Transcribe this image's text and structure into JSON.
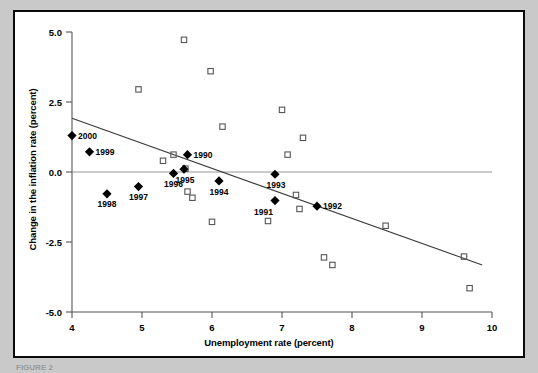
{
  "figure": {
    "caption": "FIGURE 2",
    "background_color": "#c9c9c9",
    "panel_color": "#ffffff",
    "border_color": "#0a0a0a"
  },
  "chart_data": {
    "type": "scatter",
    "title": "",
    "xlabel": "Unemployment rate (percent)",
    "ylabel": "Change in the inflation rate (percent)",
    "xlim": [
      4,
      10
    ],
    "ylim": [
      -5.0,
      5.0
    ],
    "xticks": [
      "4",
      "5",
      "6",
      "7",
      "8",
      "9",
      "10"
    ],
    "yticks": [
      "5.0",
      "2.5",
      "0.0",
      "-2.5",
      "-5.0"
    ],
    "xtick_values": [
      4,
      5,
      6,
      7,
      8,
      9,
      10
    ],
    "ytick_values": [
      5.0,
      2.5,
      0.0,
      -2.5,
      -5.0
    ],
    "grid": false,
    "legend": "none",
    "zero_line": true,
    "series": [
      {
        "name": "Labeled years (filled diamonds)",
        "marker": "filled-diamond",
        "color": "#000000",
        "points": [
          {
            "label": "2000",
            "x": 4.0,
            "y": 1.3,
            "label_pos": "right"
          },
          {
            "label": "1999",
            "x": 4.25,
            "y": 0.72,
            "label_pos": "right"
          },
          {
            "label": "1998",
            "x": 4.5,
            "y": -0.78,
            "label_pos": "below"
          },
          {
            "label": "1997",
            "x": 4.95,
            "y": -0.52,
            "label_pos": "below"
          },
          {
            "label": "1996",
            "x": 5.45,
            "y": -0.05,
            "label_pos": "below"
          },
          {
            "label": "1995",
            "x": 5.6,
            "y": 0.1,
            "label_pos": "below-right"
          },
          {
            "label": "1990",
            "x": 5.65,
            "y": 0.62,
            "label_pos": "right"
          },
          {
            "label": "1994",
            "x": 6.1,
            "y": -0.32,
            "label_pos": "below"
          },
          {
            "label": "1993",
            "x": 6.9,
            "y": -0.08,
            "label_pos": "below-right"
          },
          {
            "label": "1991",
            "x": 6.9,
            "y": -1.02,
            "label_pos": "below-left"
          },
          {
            "label": "1992",
            "x": 7.5,
            "y": -1.22,
            "label_pos": "right"
          }
        ]
      },
      {
        "name": "Other years (open squares)",
        "marker": "open-square",
        "color": "#555555",
        "points": [
          {
            "x": 4.95,
            "y": 2.95
          },
          {
            "x": 5.3,
            "y": 0.4
          },
          {
            "x": 5.45,
            "y": 0.62
          },
          {
            "x": 5.6,
            "y": 4.72
          },
          {
            "x": 5.62,
            "y": 0.12
          },
          {
            "x": 5.65,
            "y": -0.7
          },
          {
            "x": 5.72,
            "y": -0.92
          },
          {
            "x": 5.98,
            "y": 3.6
          },
          {
            "x": 6.0,
            "y": -1.78
          },
          {
            "x": 6.15,
            "y": 1.62
          },
          {
            "x": 6.8,
            "y": -1.75
          },
          {
            "x": 7.0,
            "y": 2.22
          },
          {
            "x": 7.08,
            "y": 0.62
          },
          {
            "x": 7.2,
            "y": -0.82
          },
          {
            "x": 7.3,
            "y": 1.22
          },
          {
            "x": 7.25,
            "y": -1.32
          },
          {
            "x": 7.6,
            "y": -3.05
          },
          {
            "x": 7.72,
            "y": -3.32
          },
          {
            "x": 8.48,
            "y": -1.92
          },
          {
            "x": 9.6,
            "y": -3.02
          },
          {
            "x": 9.68,
            "y": -4.15
          }
        ]
      }
    ],
    "trendline": {
      "name": "fitted regression line",
      "x_start": 4.0,
      "y_start": 1.92,
      "x_end": 9.86,
      "y_end": -3.32,
      "color": "#3a3a3a"
    }
  }
}
